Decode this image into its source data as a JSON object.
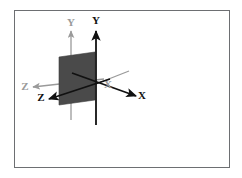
{
  "figure": {
    "background_color": "#ffffff",
    "frame": {
      "border_color": "#6d6f72",
      "x": 14,
      "y": 10,
      "width": 216,
      "height": 158
    },
    "colors": {
      "primary_axis": "#111111",
      "secondary_axis": "#9a9a9a",
      "plane_fill": "#4a4a4a",
      "plane_stroke": "#3c3c3c"
    },
    "axis_systems": [
      {
        "name": "primary-axes",
        "style": "solid-black",
        "color": "#111111",
        "axes": [
          {
            "name": "y-axis-primary",
            "label": "Y",
            "label_x": 96,
            "label_y": 24,
            "direction": "up"
          },
          {
            "name": "x-axis-primary",
            "label": "X",
            "label_x": 142,
            "label_y": 99,
            "direction": "down-right"
          },
          {
            "name": "z-axis-primary",
            "label": "Z",
            "label_x": 41,
            "label_y": 101,
            "direction": "down-left"
          }
        ]
      },
      {
        "name": "secondary-axes",
        "style": "solid-gray",
        "color": "#9a9a9a",
        "axes": [
          {
            "name": "y-axis-secondary",
            "label": "Y",
            "label_x": 71,
            "label_y": 26,
            "direction": "up"
          },
          {
            "name": "x-axis-secondary",
            "label": "X",
            "label_x": 108,
            "label_y": 88,
            "direction": "up-right"
          },
          {
            "name": "z-axis-secondary",
            "label": "Z",
            "label_x": 25,
            "label_y": 90,
            "direction": "left"
          }
        ]
      }
    ],
    "plane": {
      "name": "shaded-plane",
      "fill": "#4a4a4a",
      "points": "59,57 95,52 95,100 59,105"
    },
    "labels": {
      "y_primary": "Y",
      "y_secondary": "Y",
      "x_primary": "X",
      "x_secondary": "X",
      "z_primary": "Z",
      "z_secondary": "Z"
    }
  }
}
